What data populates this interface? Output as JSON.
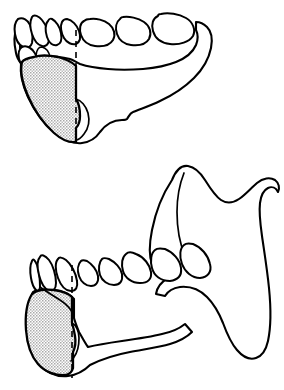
{
  "figure": {
    "kind": "anatomical-line-drawing",
    "subject": "mandible",
    "title": "Mandible with shaded symphyseal bone graft donor region",
    "background_color": "#ffffff",
    "line_color": "#000000",
    "shade_fill_color": "#c8c8c8",
    "shade_pattern": "stipple-checker",
    "canvas": {
      "width": 284,
      "height": 390
    },
    "panel_count": 2,
    "labels_present": "none"
  },
  "panels": [
    {
      "id": "panel-top",
      "view": "occlusal",
      "caption": "",
      "dashed_line": {
        "name": "midline-reference",
        "orientation": "vertical",
        "x": 76,
        "y_start": 30,
        "y_end": 143
      },
      "shaded_area": {
        "name": "symphysis-donor-site",
        "fill": "#c8c8c8",
        "outlined": true
      },
      "tooth_count": 9
    },
    {
      "id": "panel-bottom",
      "view": "lateral",
      "caption": "",
      "dashed_line": {
        "name": "midline-reference",
        "orientation": "vertical",
        "x": 72,
        "y_start": 265,
        "y_end": 378
      },
      "shaded_area": {
        "name": "symphysis-donor-site",
        "fill": "#c8c8c8",
        "outlined": true
      },
      "tooth_count": 8,
      "features": [
        "coronoid-process",
        "sigmoid-notch",
        "condyle",
        "ramus",
        "gonial-angle",
        "body-of-mandible"
      ]
    }
  ]
}
